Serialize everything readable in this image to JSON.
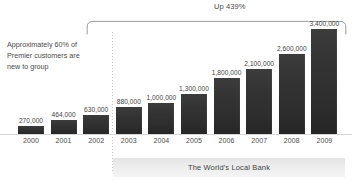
{
  "chart_data": {
    "type": "bar",
    "title": "",
    "subtitle": "",
    "xlabel": "",
    "ylabel": "",
    "categories": [
      "2000",
      "2001",
      "2002",
      "2003",
      "2004",
      "2005",
      "2006",
      "2007",
      "2008",
      "2009"
    ],
    "values": [
      270000,
      464000,
      630000,
      880000,
      1000000,
      1300000,
      1800000,
      2100000,
      2600000,
      3400000
    ],
    "value_labels": [
      "270,000",
      "464,000",
      "630,000",
      "880,000",
      "1,000,000",
      "1,300,000",
      "1,800,000",
      "2,100,000",
      "2,600,000",
      "3,400,000"
    ],
    "ylim": [
      0,
      3400000
    ],
    "grid": false,
    "legend": false,
    "bar_color": "#333333",
    "annotations": [
      {
        "name": "growth-bracket",
        "text": "Up 439%",
        "spans_categories": [
          "2002",
          "2009"
        ]
      },
      {
        "name": "premier-note",
        "lines": [
          "Approximately 60% of",
          "Premier customers are",
          "new to group"
        ]
      }
    ]
  },
  "bracket": {
    "label": "Up 439%"
  },
  "annotation": {
    "lines": [
      "Approximately 60% of",
      "Premier customers are",
      "new to group"
    ]
  },
  "footer": {
    "tagline": "The World's Local Bank"
  },
  "colors": {
    "bar": "#333333",
    "text": "#4a4a4a",
    "panel": "#ededed",
    "baseline": "#d6d6d6",
    "divider": "#c9c9c9"
  }
}
